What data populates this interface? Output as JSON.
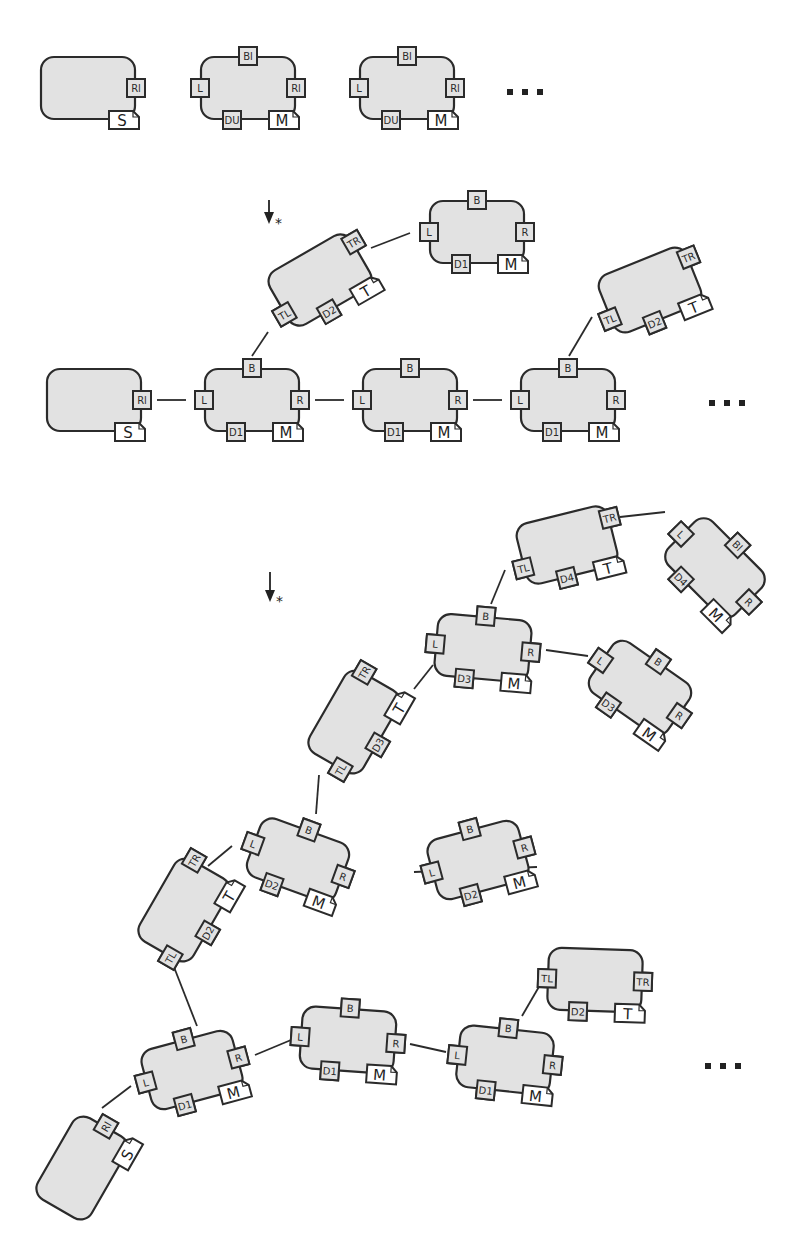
{
  "diagram": {
    "colors": {
      "tile_fill": "#e2e2e2",
      "stroke": "#2b2b2b",
      "flag_fill": "#ffffff"
    },
    "arrows": [
      {
        "id": "arrow-1",
        "x": 269,
        "y1": 200,
        "y2": 222,
        "label": "*"
      },
      {
        "id": "arrow-2",
        "x": 270,
        "y1": 572,
        "y2": 600,
        "label": "*"
      }
    ],
    "ellipses": [
      {
        "id": "ellipsis-stage1",
        "x": 523,
        "y": 92
      },
      {
        "id": "ellipsis-stage2",
        "x": 725,
        "y": 403
      },
      {
        "id": "ellipsis-stage3",
        "x": 721,
        "y": 1066
      }
    ],
    "stages": [
      {
        "name": "stage-1-tile-types",
        "tiles": [
          {
            "id": "seed",
            "cx": 88,
            "cy": 88,
            "rot": 0,
            "seed": true,
            "tabs": [
              {
                "side": "R",
                "off": 0,
                "label": "Rl"
              }
            ],
            "flag": {
              "label": "S"
            }
          },
          {
            "id": "type-a",
            "cx": 248,
            "cy": 88,
            "rot": 0,
            "tabs": [
              {
                "side": "T",
                "off": 0,
                "label": "Bl"
              },
              {
                "side": "L",
                "off": 0,
                "label": "L"
              },
              {
                "side": "R",
                "off": 0,
                "label": "Rl"
              },
              {
                "side": "B",
                "off": -16,
                "label": "DU"
              }
            ],
            "flag": {
              "label": "M"
            }
          },
          {
            "id": "type-b",
            "cx": 407,
            "cy": 88,
            "rot": 0,
            "tabs": [
              {
                "side": "T",
                "off": 0,
                "label": "Bl"
              },
              {
                "side": "L",
                "off": 0,
                "label": "L"
              },
              {
                "side": "R",
                "off": 0,
                "label": "Rl"
              },
              {
                "side": "B",
                "off": -16,
                "label": "DU"
              }
            ],
            "flag": {
              "label": "M"
            }
          }
        ]
      },
      {
        "name": "stage-2-partial-assembly",
        "tiles": [
          {
            "id": "s2-seed",
            "cx": 94,
            "cy": 400,
            "rot": 0,
            "seed": true,
            "tabs": [
              {
                "side": "R",
                "off": 0,
                "label": "Rl"
              }
            ],
            "flag": {
              "label": "S"
            }
          },
          {
            "id": "s2-row1",
            "cx": 252,
            "cy": 400,
            "rot": 0,
            "tabs": [
              {
                "side": "T",
                "off": 0,
                "label": "B"
              },
              {
                "side": "L",
                "off": 0,
                "label": "L"
              },
              {
                "side": "R",
                "off": 0,
                "label": "R"
              },
              {
                "side": "B",
                "off": -16,
                "label": "D1"
              }
            ],
            "flag": {
              "label": "M"
            }
          },
          {
            "id": "s2-row2",
            "cx": 410,
            "cy": 400,
            "rot": 0,
            "tabs": [
              {
                "side": "T",
                "off": 0,
                "label": "B"
              },
              {
                "side": "L",
                "off": 0,
                "label": "L"
              },
              {
                "side": "R",
                "off": 0,
                "label": "R"
              },
              {
                "side": "B",
                "off": -16,
                "label": "D1"
              }
            ],
            "flag": {
              "label": "M"
            }
          },
          {
            "id": "s2-row3",
            "cx": 568,
            "cy": 400,
            "rot": 0,
            "tabs": [
              {
                "side": "T",
                "off": 0,
                "label": "B"
              },
              {
                "side": "L",
                "off": 0,
                "label": "L"
              },
              {
                "side": "R",
                "off": 0,
                "label": "R"
              },
              {
                "side": "B",
                "off": -16,
                "label": "D1"
              }
            ],
            "flag": {
              "label": "M"
            }
          },
          {
            "id": "s2-turn1",
            "cx": 320,
            "cy": 280,
            "rot": -30,
            "tabs": [
              {
                "side": "L",
                "off": 12,
                "label": "TL"
              },
              {
                "side": "R",
                "off": -16,
                "label": "TR"
              },
              {
                "side": "B",
                "off": -8,
                "label": "D2"
              }
            ],
            "flag": {
              "label": "T"
            }
          },
          {
            "id": "s2-branch1",
            "cx": 477,
            "cy": 232,
            "rot": 0,
            "tabs": [
              {
                "side": "T",
                "off": 0,
                "label": "B"
              },
              {
                "side": "L",
                "off": 0,
                "label": "L"
              },
              {
                "side": "R",
                "off": 0,
                "label": "R"
              },
              {
                "side": "B",
                "off": -16,
                "label": "D1"
              }
            ],
            "flag": {
              "label": "M"
            }
          },
          {
            "id": "s2-turn2",
            "cx": 650,
            "cy": 290,
            "rot": -22,
            "tabs": [
              {
                "side": "L",
                "off": 12,
                "label": "TL"
              },
              {
                "side": "R",
                "off": -16,
                "label": "TR"
              },
              {
                "side": "B",
                "off": -8,
                "label": "D2"
              }
            ],
            "flag": {
              "label": "T"
            }
          }
        ],
        "edges": [
          [
            [
              157,
              400
            ],
            [
              186,
              400
            ]
          ],
          [
            [
              315,
              400
            ],
            [
              344,
              400
            ]
          ],
          [
            [
              473,
              400
            ],
            [
              502,
              400
            ]
          ],
          [
            [
              252,
              356
            ],
            [
              268,
              332
            ]
          ],
          [
            [
              371,
              248
            ],
            [
              410,
              233
            ]
          ],
          [
            [
              569,
              356
            ],
            [
              592,
              317
            ]
          ]
        ]
      },
      {
        "name": "stage-3-full-assembly",
        "tiles": [
          {
            "id": "s3-seed",
            "cx": 82,
            "cy": 1168,
            "rot": -60,
            "seed": true,
            "tabs": [
              {
                "side": "R",
                "off": 0,
                "label": "Rl"
              }
            ],
            "flag": {
              "label": "S"
            }
          },
          {
            "id": "s3-a1",
            "cx": 192,
            "cy": 1070,
            "rot": -15,
            "tabs": [
              {
                "side": "T",
                "off": 0,
                "label": "B"
              },
              {
                "side": "L",
                "off": 0,
                "label": "L"
              },
              {
                "side": "R",
                "off": 0,
                "label": "R"
              },
              {
                "side": "B",
                "off": -16,
                "label": "D1"
              }
            ],
            "flag": {
              "label": "M"
            }
          },
          {
            "id": "s3-a2",
            "cx": 348,
            "cy": 1040,
            "rot": 4,
            "tabs": [
              {
                "side": "T",
                "off": 0,
                "label": "B"
              },
              {
                "side": "L",
                "off": 0,
                "label": "L"
              },
              {
                "side": "R",
                "off": 0,
                "label": "R"
              },
              {
                "side": "B",
                "off": -16,
                "label": "D1"
              }
            ],
            "flag": {
              "label": "M"
            }
          },
          {
            "id": "s3-a3",
            "cx": 505,
            "cy": 1060,
            "rot": 6,
            "tabs": [
              {
                "side": "T",
                "off": 0,
                "label": "B"
              },
              {
                "side": "L",
                "off": 0,
                "label": "L"
              },
              {
                "side": "R",
                "off": 0,
                "label": "R"
              },
              {
                "side": "B",
                "off": -16,
                "label": "D1"
              }
            ],
            "flag": {
              "label": "M"
            }
          },
          {
            "id": "s3-t-low",
            "cx": 595,
            "cy": 980,
            "rot": 2,
            "tabs": [
              {
                "side": "L",
                "off": 0,
                "label": "TL"
              },
              {
                "side": "R",
                "off": 0,
                "label": "TR"
              },
              {
                "side": "B",
                "off": -16,
                "label": "D2"
              }
            ],
            "flag": {
              "label": "T"
            }
          },
          {
            "id": "s3-t1",
            "cx": 184,
            "cy": 910,
            "rot": -60,
            "tabs": [
              {
                "side": "L",
                "off": 12,
                "label": "TL"
              },
              {
                "side": "R",
                "off": -16,
                "label": "TR"
              },
              {
                "side": "B",
                "off": -8,
                "label": "D2"
              }
            ],
            "flag": {
              "label": "T"
            }
          },
          {
            "id": "s3-b1",
            "cx": 298,
            "cy": 860,
            "rot": 20,
            "tabs": [
              {
                "side": "T",
                "off": 0,
                "label": "B"
              },
              {
                "side": "L",
                "off": 0,
                "label": "L"
              },
              {
                "side": "R",
                "off": 0,
                "label": "R"
              },
              {
                "side": "B",
                "off": -16,
                "label": "D2"
              }
            ],
            "flag": {
              "label": "M"
            }
          },
          {
            "id": "s3-b2",
            "cx": 478,
            "cy": 860,
            "rot": -15,
            "tabs": [
              {
                "side": "T",
                "off": 0,
                "label": "B"
              },
              {
                "side": "L",
                "off": 0,
                "label": "L"
              },
              {
                "side": "R",
                "off": 0,
                "label": "R"
              },
              {
                "side": "B",
                "off": -16,
                "label": "D2"
              }
            ],
            "flag": {
              "label": "M"
            }
          },
          {
            "id": "s3-t2",
            "cx": 354,
            "cy": 722,
            "rot": -60,
            "tabs": [
              {
                "side": "L",
                "off": 12,
                "label": "TL"
              },
              {
                "side": "R",
                "off": -16,
                "label": "TR"
              },
              {
                "side": "B",
                "off": -8,
                "label": "D3"
              }
            ],
            "flag": {
              "label": "T"
            }
          },
          {
            "id": "s3-c1",
            "cx": 483,
            "cy": 648,
            "rot": 5,
            "tabs": [
              {
                "side": "T",
                "off": 0,
                "label": "B"
              },
              {
                "side": "L",
                "off": 0,
                "label": "L"
              },
              {
                "side": "R",
                "off": 0,
                "label": "R"
              },
              {
                "side": "B",
                "off": -16,
                "label": "D3"
              }
            ],
            "flag": {
              "label": "M"
            }
          },
          {
            "id": "s3-c2",
            "cx": 640,
            "cy": 688,
            "rot": 35,
            "tabs": [
              {
                "side": "T",
                "off": 0,
                "label": "B"
              },
              {
                "side": "L",
                "off": 0,
                "label": "L"
              },
              {
                "side": "R",
                "off": 0,
                "label": "R"
              },
              {
                "side": "B",
                "off": -16,
                "label": "D3"
              }
            ],
            "flag": {
              "label": "M"
            }
          },
          {
            "id": "s3-t3",
            "cx": 567,
            "cy": 545,
            "rot": -14,
            "tabs": [
              {
                "side": "L",
                "off": 12,
                "label": "TL"
              },
              {
                "side": "R",
                "off": -16,
                "label": "TR"
              },
              {
                "side": "B",
                "off": -8,
                "label": "D4"
              }
            ],
            "flag": {
              "label": "T"
            }
          },
          {
            "id": "s3-d1",
            "cx": 715,
            "cy": 568,
            "rot": 45,
            "tabs": [
              {
                "side": "T",
                "off": 0,
                "label": "Bl"
              },
              {
                "side": "L",
                "off": 0,
                "label": "L"
              },
              {
                "side": "R",
                "off": 0,
                "label": "R"
              },
              {
                "side": "B",
                "off": -16,
                "label": "D4"
              }
            ],
            "flag": {
              "label": "M"
            }
          }
        ],
        "edges": [
          [
            [
              102,
              1108
            ],
            [
              131,
              1086
            ]
          ],
          [
            [
              255,
              1055
            ],
            [
              291,
              1040
            ]
          ],
          [
            [
              410,
              1044
            ],
            [
              446,
              1052
            ]
          ],
          [
            [
              522,
              1016
            ],
            [
              540,
              985
            ]
          ],
          [
            [
              197,
              1026
            ],
            [
              172,
              962
            ]
          ],
          [
            [
              232,
              846
            ],
            [
              208,
              866
            ]
          ],
          [
            [
              316,
              814
            ],
            [
              319,
              775
            ]
          ],
          [
            [
              537,
              867
            ],
            [
              414,
              872
            ]
          ],
          [
            [
              414,
              689
            ],
            [
              433,
              665
            ]
          ],
          [
            [
              546,
              650
            ],
            [
              588,
              656
            ]
          ],
          [
            [
              491,
              604
            ],
            [
              505,
              570
            ]
          ],
          [
            [
              620,
              517
            ],
            [
              665,
              512
            ]
          ]
        ]
      }
    ]
  }
}
